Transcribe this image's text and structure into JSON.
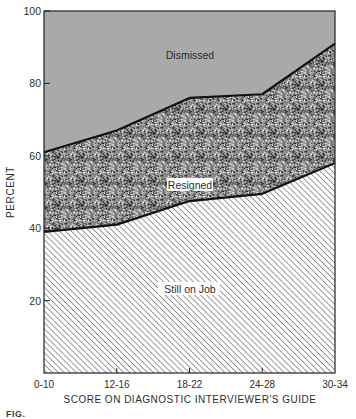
{
  "chart_data": {
    "type": "area",
    "stacked": true,
    "title": "",
    "xlabel": "SCORE ON DIAGNOSTIC INTERVIEWER'S GUIDE",
    "ylabel": "PERCENT",
    "ylim": [
      0,
      100
    ],
    "yticks": [
      20,
      40,
      60,
      80,
      100
    ],
    "categories": [
      "0-10",
      "12-16",
      "18-22",
      "24-28",
      "30-34"
    ],
    "series": [
      {
        "name": "Still on Job",
        "values": [
          39,
          41,
          47.5,
          49.5,
          58
        ],
        "fill": "hatch"
      },
      {
        "name": "Resigned",
        "values": [
          22,
          26,
          28.5,
          27.5,
          33
        ],
        "fill": "stipple"
      },
      {
        "name": "Dismissed",
        "values": [
          39,
          33,
          24,
          23,
          9
        ],
        "fill": "#a9a9a9"
      }
    ],
    "cumulative_boundaries": {
      "still_on_job_top": [
        39,
        41,
        47.5,
        49.5,
        58
      ],
      "resigned_top": [
        61,
        67,
        76,
        77,
        91
      ]
    },
    "annotations": [
      {
        "text": "Dismissed",
        "series": "Dismissed"
      },
      {
        "text": "Resigned",
        "series": "Resigned"
      },
      {
        "text": "Still on Job",
        "series": "Still on Job"
      }
    ],
    "grid": false,
    "legend": "inline labels"
  },
  "labels": {
    "y_axis_title": "PERCENT",
    "x_axis_title": "SCORE ON DIAGNOSTIC INTERVIEWER'S GUIDE",
    "region_dismissed": "Dismissed",
    "region_resigned": "Resigned",
    "region_still_on_job": "Still on Job",
    "caption_fragment": "FIG."
  },
  "colors": {
    "dismissed_fill": "#a9a9a9",
    "stipple_dark": "#2b2b2b",
    "stipple_light": "#e6e6e6",
    "hatch_line": "#555555",
    "boundary_line": "#111111",
    "axis": "#222222"
  }
}
